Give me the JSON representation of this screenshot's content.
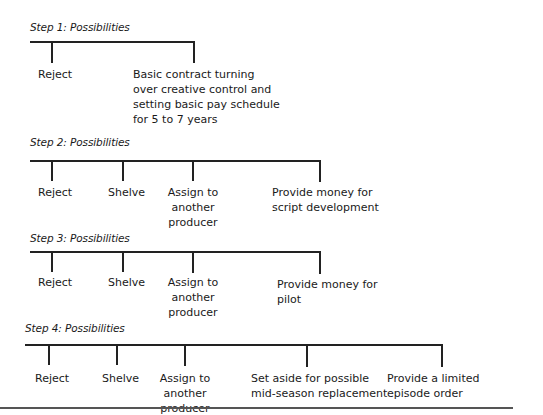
{
  "steps": [
    {
      "title": "Step 1: Possibilities",
      "options": [
        "Reject",
        "Basic contract turning\nover creative control and\nsetting basic pay schedule\nfor 5 to 7 years"
      ]
    },
    {
      "title": "Step 2: Possibilities",
      "options": [
        "Reject",
        "Shelve",
        "Assign to\nanother producer",
        "Provide money for\nscript development"
      ]
    },
    {
      "title": "Step 3: Possibilities",
      "options": [
        "Reject",
        "Shelve",
        "Assign to\nanother producer",
        "Provide money for\npilot"
      ]
    },
    {
      "title": "Step 4: Possibilities",
      "options": [
        "Reject",
        "Shelve",
        "Assign to\nanother producer",
        "Set aside for possible\nmid-season replacement",
        "Provide a limited\nepisode order"
      ]
    }
  ]
}
